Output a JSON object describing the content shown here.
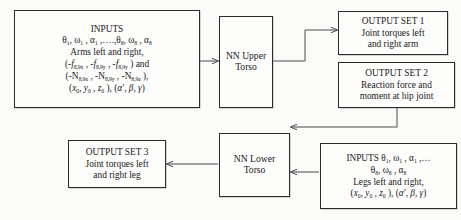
{
  "diagram": {
    "accent_color": "#2b2b2b",
    "arrow_color": "#4a4a4a",
    "background_color": "#fbfbfa"
  },
  "blocks": {
    "inputs_upper": {
      "name": "INPUTS",
      "lines": [
        "INPUTS",
        "θ₁, ω₁ , α₁ ,….,θ₈, ω₈ , α₈",
        "Arms left and right,",
        "(-f₈,₉ₓ , -f₈,₉ᵧ , -f₈,₉ᵧ ) and",
        "(-N₈,₉ₓ , -N₈,₉ᵧ , -N₈,₉ᶻ ),",
        "(x₀, y₀ , z₀ ), (α′, β, γ)"
      ],
      "heading": "INPUTS",
      "line_theta": "θ",
      "line_arms": "Arms left and right,",
      "line_f": "f",
      "line_n": "N",
      "line_coords": "(x"
    },
    "nn_upper": {
      "line1": "NN Upper",
      "line2": "Torso"
    },
    "output_1": {
      "line1": "OUTPUT SET 1",
      "line2": "Joint torques left",
      "line3": "and right arm"
    },
    "output_2": {
      "line1": "OUTPUT SET 2",
      "line2": "Reaction force and",
      "line3": "moment at hip joint"
    },
    "output_3": {
      "line1": "OUTPUT SET 3",
      "line2": "Joint torques left",
      "line3": "and right leg"
    },
    "nn_lower": {
      "line1": "NN Lower",
      "line2": "Torso"
    },
    "inputs_lower": {
      "lines": [
        "INPUTS θ₁, ω₁ , α₁ ,…",
        "θ₈, ω₈ , α₈",
        "Legs left and right,",
        "(x₀, y₀ , z₀ ), (α′, β, γ)"
      ],
      "heading": "INPUTS",
      "line_legs": "Legs left and right,"
    }
  },
  "symbols": {
    "theta": "θ",
    "omega": "ω",
    "alpha": "α",
    "beta": "β",
    "gamma": "γ",
    "alpha_prime": "α′",
    "ellipsis": ",….,",
    "ellipsis_short": ",…",
    "sub_1": "1",
    "sub_8": "8",
    "sub_89x": "8,9x",
    "sub_89y": "8,9y",
    "sub_89z": "8,9z",
    "sub_0": "0",
    "f": "f",
    "N": "N",
    "x": "x",
    "y": "y",
    "z": "z",
    "and": " ) and",
    "comma_close": " ),"
  },
  "edges": [
    {
      "name": "inputs-upper-to-nn-upper",
      "from": "inputs_upper",
      "to": "nn_upper"
    },
    {
      "name": "nn-upper-to-output-1",
      "from": "nn_upper",
      "to": "output_1"
    },
    {
      "name": "output-2-to-nn-lower",
      "from": "output_2",
      "to": "nn_lower"
    },
    {
      "name": "inputs-lower-to-nn-lower",
      "from": "inputs_lower",
      "to": "nn_lower"
    },
    {
      "name": "nn-lower-to-output-3",
      "from": "nn_lower",
      "to": "output_3"
    }
  ]
}
